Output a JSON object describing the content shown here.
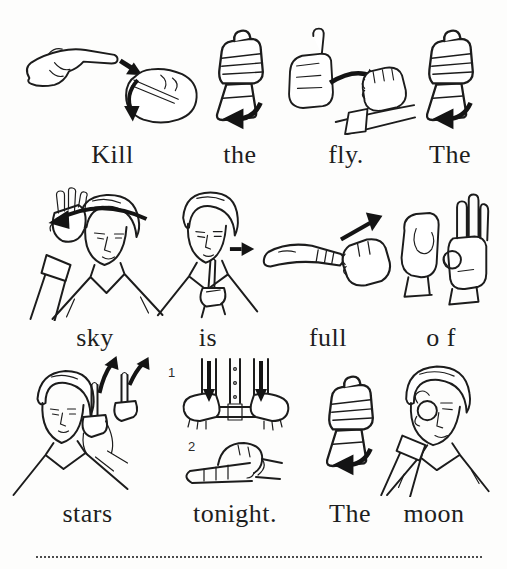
{
  "page": {
    "background": "#fdfdfc",
    "ink_color": "#1c1c1c",
    "caption_color": "#1e1e1e"
  },
  "sentence": "Kill the fly. The sky is full of stars tonight. The moon",
  "rows": [
    {
      "cells": [
        {
          "word": "Kill",
          "sign": "kill - index finger strikes through opposite palm, arrows show twisting strike"
        },
        {
          "word": "the",
          "sign": "the - upright fist twists outward, curved arrow below"
        },
        {
          "word": "fly.",
          "sign": "fly - open hand sweeps across and grasps above forearm, thick arrow"
        },
        {
          "word": "The",
          "sign": "the - upright fist twists outward, curved arrow below"
        }
      ]
    },
    {
      "cells": [
        {
          "word": "sky",
          "sign": "sky - open hand arcs over the head, long arrow sweeping left"
        },
        {
          "word": "is",
          "sign": "is - index finger at chin moves forward, small arrow right"
        },
        {
          "word": "full",
          "sign": "full - flat hand brushes over closed fist, arrow up to the right"
        },
        {
          "word": "o f",
          "sign": "of - fingerspelled O handshape and F handshape"
        }
      ]
    },
    {
      "cells": [
        {
          "word": "stars",
          "sign": "stars - alternating index fingers point upward, two arrows rising"
        },
        {
          "word": "tonight.",
          "sign": "tonight - step 1 bent hands move down at waist, step 2 bent hand settles over flat hand",
          "step_labels": [
            "1",
            "2"
          ]
        },
        {
          "word": "The",
          "sign": "the - upright fist twists outward, curved arrow below"
        },
        {
          "word": "moon",
          "sign": "moon - crescent C hand held around the eye"
        }
      ]
    }
  ]
}
